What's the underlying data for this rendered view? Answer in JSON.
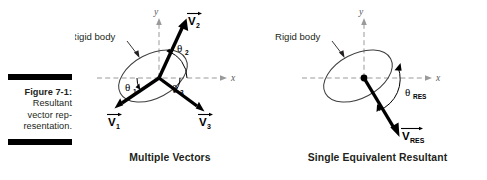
{
  "figure": {
    "caption_label": "Figure 7-1:",
    "caption_lines": [
      "Resultant",
      "vector rep-",
      "resentation."
    ]
  },
  "panels": [
    {
      "id": "multiple-vectors",
      "title": "Multiple Vectors",
      "body_label": "Rigid body",
      "axis_x_label": "x",
      "axis_y_label": "y",
      "vectors": [
        {
          "name": "V2",
          "label": "V",
          "subscript": "2",
          "angle_deg": 72,
          "length": 62
        },
        {
          "name": "V1",
          "label": "V",
          "subscript": "1",
          "angle_deg": 213,
          "length": 56
        },
        {
          "name": "V3",
          "label": "V",
          "subscript": "3",
          "angle_deg": 318,
          "length": 58
        }
      ],
      "angles": [
        {
          "name": "theta1",
          "symbol": "θ",
          "subscript": "1",
          "from_deg": 180,
          "to_deg": 213
        },
        {
          "name": "theta2",
          "symbol": "θ",
          "subscript": "2",
          "from_deg": 0,
          "to_deg": 72
        },
        {
          "name": "theta3",
          "symbol": "θ",
          "subscript": "3",
          "from_deg": 0,
          "to_deg": 318
        }
      ]
    },
    {
      "id": "single-equivalent-resultant",
      "title": "Single Equivalent Resultant",
      "body_label": "Rigid body",
      "axis_x_label": "x",
      "axis_y_label": "y",
      "vectors": [
        {
          "name": "VRES",
          "label": "V",
          "subscript": "RES",
          "angle_deg": 295,
          "length": 72
        }
      ],
      "angles": [
        {
          "name": "thetaRES",
          "symbol": "θ",
          "subscript": "RES",
          "from_deg": 0,
          "to_deg": 295
        }
      ]
    }
  ],
  "colors": {
    "ink": "#231f20",
    "axis": "#9a9a9a",
    "vector": "#000000",
    "body_outline": "#3f3f3f"
  }
}
